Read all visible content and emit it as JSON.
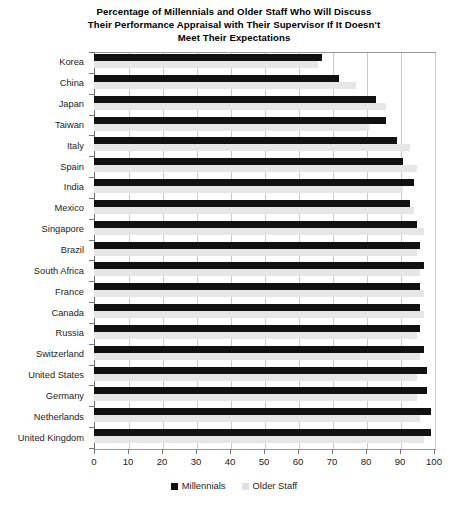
{
  "chart_data": {
    "type": "bar",
    "orientation": "horizontal",
    "title": "Percentage of Millennials and Older Staff Who Will Discuss Their Performance Appraisal with Their Supervisor If It Doesn't Meet Their Expectations",
    "title_lines": [
      "Percentage of Millennials and Older Staff Who Will Discuss",
      "Their Performance Appraisal with Their Supervisor If It Doesn't",
      "Meet Their Expectations"
    ],
    "xlabel": "",
    "ylabel": "",
    "xlim": [
      0,
      100
    ],
    "ylim": null,
    "grid": true,
    "grid_axis": "x",
    "legend_position": "bottom",
    "categories": [
      "Korea",
      "China",
      "Japan",
      "Taiwan",
      "Italy",
      "Spain",
      "India",
      "Mexico",
      "Singapore",
      "Brazil",
      "South Africa",
      "France",
      "Canada",
      "Russia",
      "Switzerland",
      "United States",
      "Germany",
      "Netherlands",
      "United Kingdom"
    ],
    "series": [
      {
        "name": "Millennials",
        "color": "#111111",
        "values": [
          67,
          72,
          83,
          86,
          89,
          91,
          94,
          93,
          95,
          96,
          97,
          96,
          96,
          96,
          97,
          98,
          98,
          99,
          99
        ]
      },
      {
        "name": "Older Staff",
        "color": "#e6e6e6",
        "values": [
          66,
          77,
          86,
          81,
          93,
          95,
          91,
          94,
          97,
          95,
          96,
          97,
          97,
          95,
          96,
          95,
          95,
          96,
          97
        ]
      }
    ],
    "xticks": [
      0,
      10,
      20,
      30,
      40,
      50,
      60,
      70,
      80,
      90,
      100
    ],
    "xticklabels": [
      "0",
      "10",
      "20",
      "30",
      "40",
      "50",
      "60",
      "70",
      "80",
      "90",
      "100"
    ]
  },
  "legend": {
    "items": [
      {
        "label": "Millennials",
        "swatch": "millennials"
      },
      {
        "label": "Older Staff",
        "swatch": "older"
      }
    ]
  },
  "colors": {
    "millennials": "#111111",
    "older_staff": "#e6e6e6",
    "grid": "#c9c9c9",
    "axis": "#6f6f6f",
    "text": "#1c1c1c"
  }
}
